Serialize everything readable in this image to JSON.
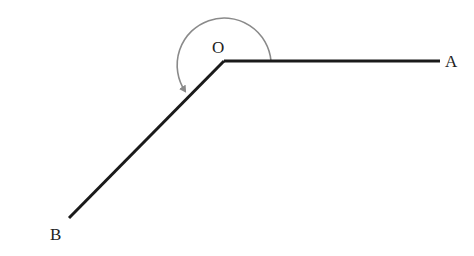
{
  "diagram": {
    "vertex": {
      "label": "O",
      "x": 224,
      "y": 61
    },
    "rays": [
      {
        "label": "A",
        "end": {
          "x": 440,
          "y": 61
        }
      },
      {
        "label": "B",
        "end": {
          "x": 69,
          "y": 218
        }
      }
    ],
    "arc": {
      "radius": 47,
      "direction": "counterclockwise",
      "arrow": true,
      "color": "#8a8a8a"
    },
    "line_color": "#1a1a1a",
    "labels": {
      "O": "O",
      "A": "A",
      "B": "B"
    }
  }
}
